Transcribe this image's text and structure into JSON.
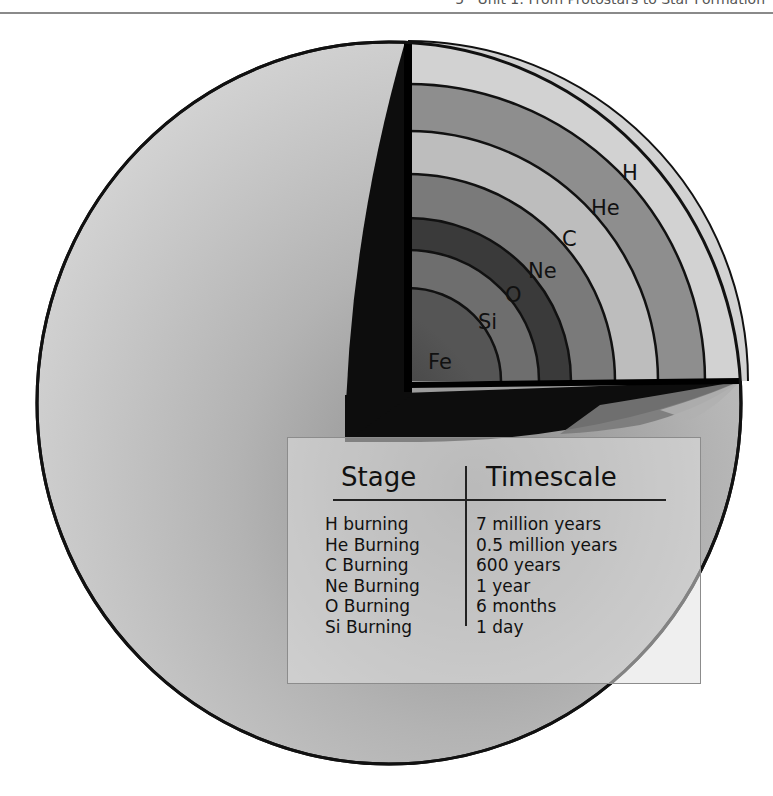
{
  "header": {
    "text": "5 · Unit 1: From Protostars to Star Formation"
  },
  "diagram": {
    "center": {
      "x": 408,
      "y": 381
    },
    "layers": [
      {
        "label": "H",
        "outer_radius": 340,
        "color": "#d2d2d2"
      },
      {
        "label": "He",
        "outer_radius": 297,
        "color": "#8e8e8e"
      },
      {
        "label": "C",
        "outer_radius": 250,
        "color": "#bdbdbd"
      },
      {
        "label": "Ne",
        "outer_radius": 207,
        "color": "#7a7a7a"
      },
      {
        "label": "O",
        "outer_radius": 163,
        "color": "#3a3a3a"
      },
      {
        "label": "Si",
        "outer_radius": 131,
        "color": "#6e6e6e"
      },
      {
        "label": "Fe",
        "outer_radius": 93,
        "color": "#4a4a4a"
      }
    ],
    "colors": {
      "sphere_light": "#d9d9d9",
      "sphere_dark": "#8f8f8f",
      "wedge_dark": "#0d0d0d",
      "outline": "#111111"
    }
  },
  "table": {
    "headers": {
      "stage": "Stage",
      "timescale": "Timescale"
    },
    "rows": [
      {
        "stage": "H burning",
        "timescale": "7 million years"
      },
      {
        "stage": "He Burning",
        "timescale": "0.5 million years"
      },
      {
        "stage": "C Burning",
        "timescale": "600 years"
      },
      {
        "stage": "Ne Burning",
        "timescale": "1 year"
      },
      {
        "stage": "O Burning",
        "timescale": "6 months"
      },
      {
        "stage": "Si Burning",
        "timescale": "1 day"
      }
    ]
  }
}
